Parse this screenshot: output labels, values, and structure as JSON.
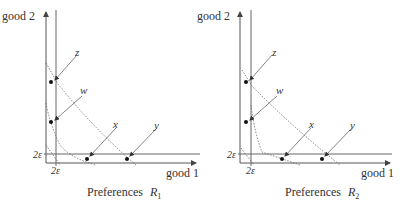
{
  "panels": [
    {
      "caption": "Preferences",
      "caption_var": "R",
      "caption_sub": "1",
      "y_axis_label": "good 2",
      "x_axis_label": "good 1",
      "epsilon_x_label": "2ε",
      "epsilon_y_label": "2ε",
      "points": [
        {
          "label": "z"
        },
        {
          "label": "w"
        },
        {
          "label": "x"
        },
        {
          "label": "y"
        }
      ]
    },
    {
      "caption": "Preferences",
      "caption_var": "R",
      "caption_sub": "2",
      "y_axis_label": "good 2",
      "x_axis_label": "good 1",
      "epsilon_x_label": "2ε",
      "epsilon_y_label": "2ε",
      "points": [
        {
          "label": "z"
        },
        {
          "label": "w"
        },
        {
          "label": "x"
        },
        {
          "label": "y"
        }
      ]
    }
  ],
  "colors": {
    "axis": "#555555",
    "line": "#777777",
    "dotted": "#666666",
    "dot": "#111111",
    "text": "#333333"
  }
}
